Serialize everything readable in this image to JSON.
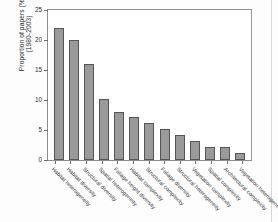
{
  "chart_data": {
    "type": "bar",
    "title": "",
    "xlabel": "",
    "ylabel": "Proportion of papers (%)",
    "ylabel_line2": "(1980-2003)",
    "ylim": [
      0,
      25
    ],
    "yticks": [
      0,
      5,
      10,
      15,
      20,
      25
    ],
    "ytick_labels": [
      "0",
      "5",
      "10",
      "15",
      "20",
      "25"
    ],
    "grid": false,
    "legend": false,
    "bar_color": "#9a9a9a",
    "bar_edge_color": "#555555",
    "axis_color": "#8d8d8d",
    "categories": [
      "Habitat heterogeneity",
      "Habitat diversity",
      "Structural diversity",
      "Spatial heterogeneity",
      "Foliage height diversity",
      "Habitat complexity",
      "Structural complexity",
      "Foliage diversity",
      "Structural heterogeneity",
      "Vegetation complexity",
      "Spatial complexity",
      "Architectural complexity",
      "Vegetation heterogeneity"
    ],
    "values": [
      22.0,
      20.0,
      16.0,
      10.1,
      8.0,
      7.1,
      6.1,
      5.1,
      4.1,
      3.2,
      2.2,
      2.2,
      1.2
    ]
  }
}
